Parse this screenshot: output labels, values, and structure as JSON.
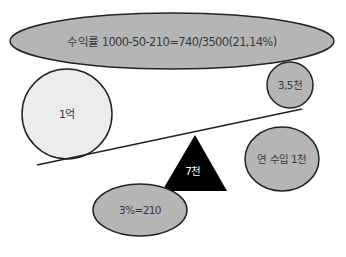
{
  "diagram": {
    "type": "balance-scale",
    "top_banner": {
      "label": "수익률 1000-50-210=740/3500(21,14%)"
    },
    "left_weight": {
      "label": "1억"
    },
    "right_weight": {
      "label": "3,5천"
    },
    "fulcrum": {
      "label": "7천"
    },
    "bottom_left": {
      "label": "3%=210"
    },
    "right_side": {
      "label": "연 수입 1천"
    },
    "colors": {
      "ellipse_fill": "#b5b5b5",
      "light_circle_fill": "#ececec",
      "stroke": "#222222",
      "fulcrum_fill": "#000000",
      "fulcrum_text": "#ffffff"
    }
  }
}
